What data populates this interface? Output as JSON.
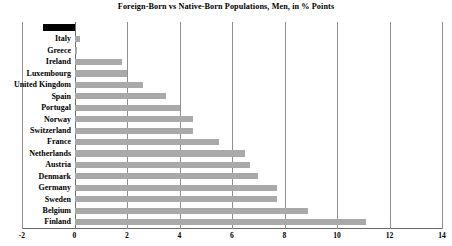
{
  "chart_data": {
    "type": "bar",
    "orientation": "horizontal",
    "title": "Foreign-Born vs Native-Born Populations, Men, in % Points",
    "xlabel": "",
    "ylabel": "",
    "xlim": [
      -2,
      14
    ],
    "xticks": [
      "-2",
      "0",
      "2",
      "4",
      "6",
      "8",
      "10",
      "12",
      "14"
    ],
    "xtick_values": [
      -2,
      0,
      2,
      4,
      6,
      8,
      10,
      12,
      14
    ],
    "grid": "vertical",
    "legend": "none",
    "categories": [
      "US",
      "Italy",
      "Greece",
      "Ireland",
      "Luxembourg",
      "United Kingdom",
      "Spain",
      "Portugal",
      "Norway",
      "Switzerland",
      "France",
      "Netherlands",
      "Austria",
      "Denmark",
      "Germany",
      "Sweden",
      "Belgium",
      "Finland"
    ],
    "values": [
      -1.2,
      0.2,
      0.1,
      1.8,
      2.0,
      2.6,
      3.5,
      4.0,
      4.5,
      4.5,
      5.5,
      6.5,
      6.7,
      7.0,
      7.7,
      7.7,
      8.9,
      11.1
    ],
    "bar_color": "#a9a9a9",
    "highlight_color": "#000000",
    "highlight_category": "US"
  }
}
